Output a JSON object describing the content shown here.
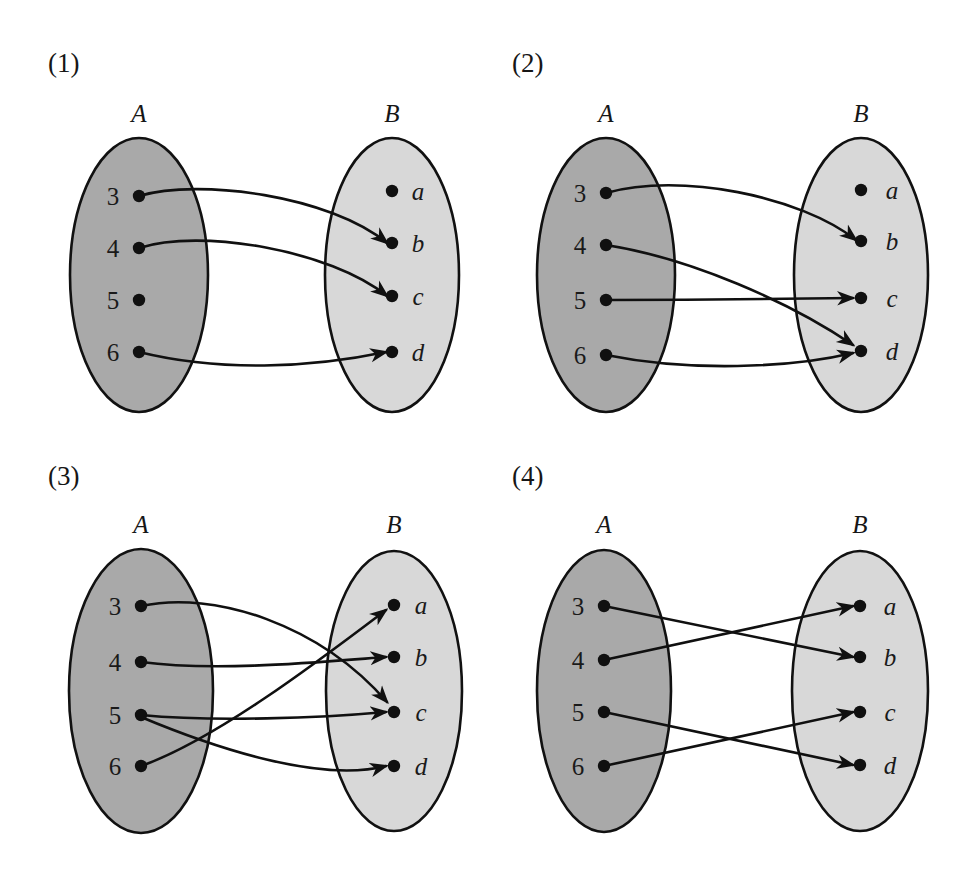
{
  "figure": {
    "background_color": "#ffffff",
    "line_color": "#101010",
    "set_a_fill": "#a9a9a9",
    "set_b_fill": "#d8d8d8",
    "set_a_label": "A",
    "set_b_label": "B",
    "domain_elements": [
      "3",
      "4",
      "5",
      "6"
    ],
    "codomain_elements": [
      "a",
      "b",
      "c",
      "d"
    ]
  },
  "panels": [
    {
      "id": "panel-1",
      "number_label": "(1)",
      "set_a": {
        "label": "A",
        "elements": [
          "3",
          "4",
          "5",
          "6"
        ]
      },
      "set_b": {
        "label": "B",
        "elements": [
          "a",
          "b",
          "c",
          "d"
        ]
      },
      "arrows": [
        {
          "from": "3",
          "to": "b"
        },
        {
          "from": "4",
          "to": "c"
        },
        {
          "from": "6",
          "to": "d"
        }
      ],
      "unmapped_domain_elements": [
        "5"
      ]
    },
    {
      "id": "panel-2",
      "number_label": "(2)",
      "set_a": {
        "label": "A",
        "elements": [
          "3",
          "4",
          "5",
          "6"
        ]
      },
      "set_b": {
        "label": "B",
        "elements": [
          "a",
          "b",
          "c",
          "d"
        ]
      },
      "arrows": [
        {
          "from": "3",
          "to": "b"
        },
        {
          "from": "4",
          "to": "d"
        },
        {
          "from": "5",
          "to": "c"
        },
        {
          "from": "6",
          "to": "d"
        }
      ],
      "unmapped_domain_elements": []
    },
    {
      "id": "panel-3",
      "number_label": "(3)",
      "set_a": {
        "label": "A",
        "elements": [
          "3",
          "4",
          "5",
          "6"
        ]
      },
      "set_b": {
        "label": "B",
        "elements": [
          "a",
          "b",
          "c",
          "d"
        ]
      },
      "arrows": [
        {
          "from": "3",
          "to": "c"
        },
        {
          "from": "4",
          "to": "b"
        },
        {
          "from": "5",
          "to": "c"
        },
        {
          "from": "5",
          "to": "d"
        },
        {
          "from": "6",
          "to": "a"
        }
      ],
      "unmapped_domain_elements": []
    },
    {
      "id": "panel-4",
      "number_label": "(4)",
      "set_a": {
        "label": "A",
        "elements": [
          "3",
          "4",
          "5",
          "6"
        ]
      },
      "set_b": {
        "label": "B",
        "elements": [
          "a",
          "b",
          "c",
          "d"
        ]
      },
      "arrows": [
        {
          "from": "3",
          "to": "b"
        },
        {
          "from": "4",
          "to": "a"
        },
        {
          "from": "5",
          "to": "d"
        },
        {
          "from": "6",
          "to": "c"
        }
      ],
      "unmapped_domain_elements": []
    }
  ]
}
